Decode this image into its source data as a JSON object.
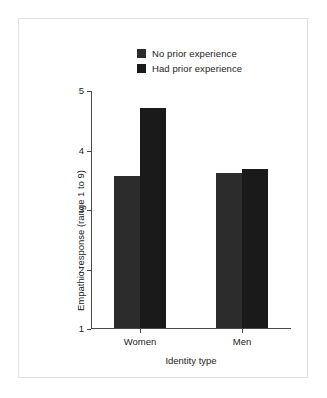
{
  "chart_data": {
    "type": "bar",
    "title": "",
    "subtitle": "",
    "xlabel": "Identity type",
    "ylabel": "Empathic response (range 1 to 9)",
    "categories": [
      "Women",
      "Men"
    ],
    "series": [
      {
        "name": "No prior experience",
        "values": [
          3.55,
          3.6
        ],
        "color": "#2c2c2c"
      },
      {
        "name": "Had prior experience",
        "values": [
          4.7,
          3.67
        ],
        "color": "#1a1a1a"
      }
    ],
    "ylim": [
      1,
      5
    ],
    "yticks": [
      1,
      2,
      3,
      4,
      5
    ],
    "ytick_labels": [
      "1",
      "2",
      "3",
      "4",
      "5"
    ],
    "grid": false,
    "legend_position": "top-center",
    "annotations": []
  },
  "legend": {
    "entries": [
      {
        "label": "No prior experience",
        "color": "#2c2c2c"
      },
      {
        "label": "Had prior experience",
        "color": "#1a1a1a"
      }
    ]
  },
  "axes": {
    "y_title": "Empathic response (range 1 to 9)",
    "x_title": "Identity type",
    "y_tick_labels": [
      "5",
      "4",
      "3",
      "2",
      "1"
    ],
    "x_tick_labels": [
      "Women",
      "Men"
    ]
  },
  "colors": {
    "background": "#ffffff",
    "frame": "#e2e2e2",
    "axis": "#4a4a4a",
    "text": "#1c1c1c",
    "series_1": "#2c2c2c",
    "series_2": "#1a1a1a"
  }
}
